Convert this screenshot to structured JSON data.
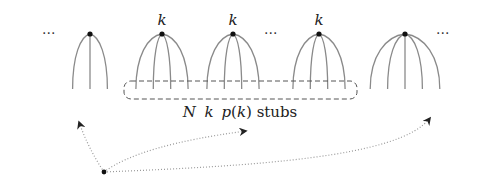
{
  "diagram": {
    "nodes": [
      {
        "id": "node-1",
        "degree": 3,
        "label": ""
      },
      {
        "id": "node-2",
        "degree": 4,
        "label": "k"
      },
      {
        "id": "node-3",
        "degree": 4,
        "label": "k"
      },
      {
        "id": "node-4",
        "degree": 4,
        "label": "k"
      },
      {
        "id": "node-5",
        "degree": 5,
        "label": ""
      }
    ],
    "ellipsis_symbol": "···",
    "stub_group_caption": {
      "N": "N",
      "k": "k",
      "p": "p",
      "open": "(",
      "k_inner": "k",
      "close": ")",
      "suffix": " stubs"
    },
    "source_point": {
      "label": ""
    },
    "arrows": [
      "to-node-1-stubs",
      "to-stub-group",
      "to-node-5-stubs"
    ]
  }
}
